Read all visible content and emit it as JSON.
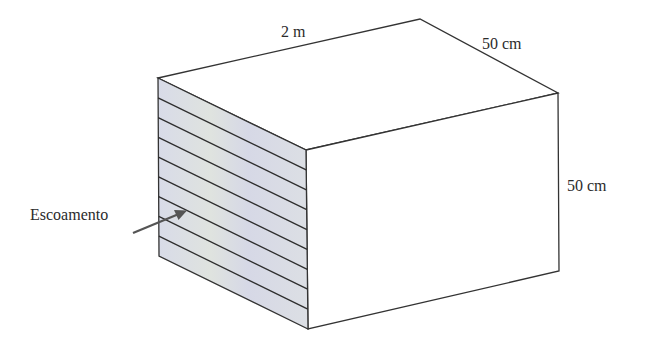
{
  "diagram": {
    "type": "rectangular-duct-isometric",
    "labels": {
      "length": "2 m",
      "depth": "50 cm",
      "height": "50 cm",
      "flow": "Escoamento"
    },
    "side_face": {
      "fill_color": "#d9dce6",
      "stripe_count": 8
    },
    "colors": {
      "edge": "#333333",
      "arrow": "#555555",
      "background": "#ffffff"
    }
  }
}
